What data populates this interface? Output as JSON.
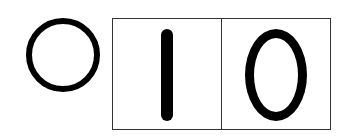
{
  "symbol": {
    "shape": "circle",
    "meaning": "zero"
  },
  "digits": [
    {
      "value": "1"
    },
    {
      "value": "0"
    }
  ],
  "colors": {
    "ink": "#000000",
    "border": "#333333",
    "background": "#ffffff"
  }
}
